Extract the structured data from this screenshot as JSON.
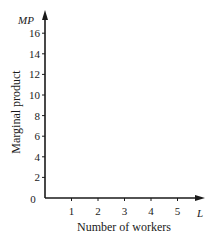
{
  "chart_data": {
    "type": "line",
    "title": "",
    "xlabel": "Number of workers",
    "ylabel": "Marginal product",
    "x_axis_variable": "L",
    "y_axis_variable": "MP",
    "x_ticks": [
      1,
      2,
      3,
      4,
      5
    ],
    "y_ticks": [
      2,
      4,
      6,
      8,
      10,
      12,
      14,
      16
    ],
    "origin_label": "0",
    "xlim": [
      0,
      6
    ],
    "ylim": [
      0,
      17
    ],
    "grid": false,
    "legend": null,
    "series": []
  },
  "colors": {
    "axis": "#1a1a1a",
    "background": "#ffffff"
  }
}
